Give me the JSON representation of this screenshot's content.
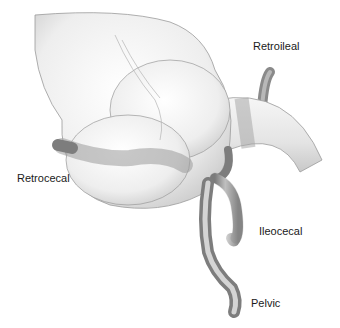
{
  "figure": {
    "labels": {
      "retroileal": "Retroileal",
      "retrocecal": "Retrocecal",
      "ileocecal": "Ileocecal",
      "pelvic": "Pelvic"
    },
    "colors": {
      "background": "#ffffff",
      "organ_fill": "#eeeeee",
      "organ_stroke": "#8a8a8a",
      "appendix_fill": "#9a9a9a",
      "label_text": "#1a1a1a"
    }
  }
}
